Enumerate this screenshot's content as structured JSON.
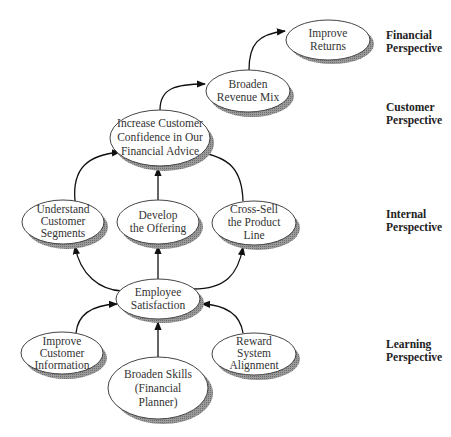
{
  "diagram": {
    "type": "strategy-map",
    "perspectives": [
      {
        "id": "financial",
        "line1": "Financial",
        "line2": "Perspective",
        "top": 29
      },
      {
        "id": "customer",
        "line1": "Customer",
        "line2": "Perspective",
        "top": 101
      },
      {
        "id": "internal",
        "line1": "Internal",
        "line2": "Perspective",
        "top": 208
      },
      {
        "id": "learning",
        "line1": "Learning",
        "line2": "Perspective",
        "top": 338
      }
    ],
    "nodes": {
      "improve_returns": {
        "lines": [
          "Improve",
          "Returns"
        ]
      },
      "broaden_revenue_mix": {
        "lines": [
          "Broaden",
          "Revenue Mix"
        ]
      },
      "increase_confidence": {
        "lines": [
          "Increase Customer",
          "Confidence in Our",
          "Financial Advice"
        ]
      },
      "understand_segments": {
        "lines": [
          "Understand",
          "Customer",
          "Segments"
        ]
      },
      "develop_offering": {
        "lines": [
          "Develop",
          "the Offering"
        ]
      },
      "cross_sell": {
        "lines": [
          "Cross-Sell",
          "the Product",
          "Line"
        ]
      },
      "employee_satisfaction": {
        "lines": [
          "Employee",
          "Satisfaction"
        ]
      },
      "improve_customer_info": {
        "lines": [
          "Improve",
          "Customer",
          "Information"
        ]
      },
      "broaden_skills": {
        "lines": [
          "Broaden Skills",
          "(Financial",
          "Planner)"
        ]
      },
      "reward_alignment": {
        "lines": [
          "Reward",
          "System",
          "Alignment"
        ]
      }
    },
    "edges": [
      {
        "from": "broaden_revenue_mix",
        "to": "improve_returns"
      },
      {
        "from": "increase_confidence",
        "to": "broaden_revenue_mix"
      },
      {
        "from": "understand_segments",
        "to": "increase_confidence"
      },
      {
        "from": "develop_offering",
        "to": "increase_confidence"
      },
      {
        "from": "cross_sell",
        "to": "increase_confidence"
      },
      {
        "from": "employee_satisfaction",
        "to": "understand_segments"
      },
      {
        "from": "employee_satisfaction",
        "to": "develop_offering"
      },
      {
        "from": "employee_satisfaction",
        "to": "cross_sell"
      },
      {
        "from": "improve_customer_info",
        "to": "employee_satisfaction"
      },
      {
        "from": "broaden_skills",
        "to": "employee_satisfaction"
      },
      {
        "from": "reward_alignment",
        "to": "employee_satisfaction"
      }
    ],
    "colors": {
      "node_fill": "#ffffff",
      "node_stroke": "#444444",
      "shadow": "#8a8a8a",
      "edge": "#111111"
    }
  }
}
